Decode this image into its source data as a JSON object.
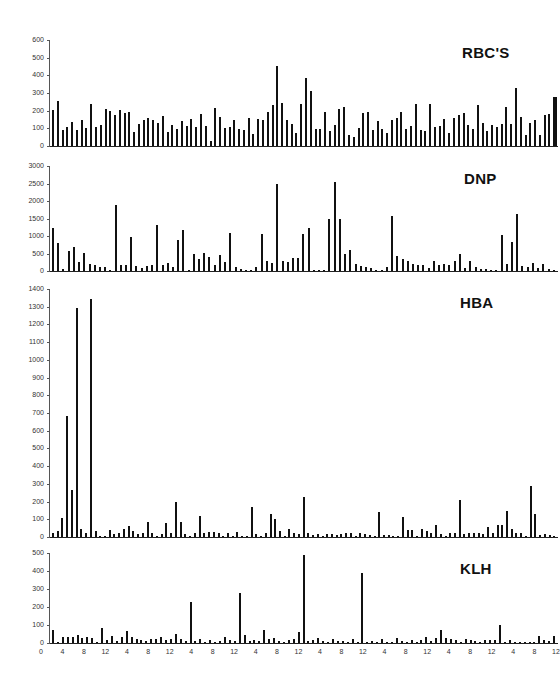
{
  "figure": {
    "x_tick_labels": [
      "0",
      "4",
      "8",
      "12",
      "4",
      "8",
      "12",
      "4",
      "8",
      "12",
      "4",
      "8",
      "12",
      "4",
      "8",
      "12",
      "4",
      "8",
      "12",
      "4",
      "8",
      "12",
      "4",
      "8",
      "12"
    ]
  },
  "chart_data": [
    {
      "type": "bar",
      "title": "RBC'S",
      "xlabel": "",
      "ylabel": "",
      "ylim": [
        0,
        600
      ],
      "yticks": [
        0,
        100,
        200,
        300,
        400,
        500,
        600
      ],
      "grid": false,
      "x_tick_labels": [
        "0",
        "4",
        "8",
        "12",
        "4",
        "8",
        "12",
        "4",
        "8",
        "12",
        "4",
        "8",
        "12",
        "4",
        "8",
        "12",
        "4",
        "8",
        "12",
        "4",
        "8",
        "12",
        "4",
        "8",
        "12"
      ],
      "values": [
        205,
        255,
        90,
        110,
        135,
        90,
        150,
        100,
        235,
        105,
        120,
        210,
        200,
        175,
        205,
        185,
        195,
        80,
        125,
        150,
        160,
        150,
        130,
        170,
        80,
        120,
        95,
        140,
        115,
        155,
        110,
        180,
        115,
        30,
        215,
        165,
        100,
        105,
        150,
        95,
        90,
        160,
        70,
        155,
        145,
        195,
        230,
        455,
        245,
        145,
        125,
        75,
        240,
        385,
        310,
        95,
        95,
        190,
        85,
        120,
        210,
        220,
        60,
        50,
        100,
        185,
        195,
        90,
        140,
        95,
        75,
        150,
        160,
        195,
        95,
        115,
        235,
        90,
        85,
        240,
        110,
        115,
        155,
        75,
        160,
        175,
        185,
        120,
        95,
        230,
        130,
        85,
        120,
        110,
        125,
        220,
        125,
        330,
        165,
        65,
        130,
        150,
        65,
        175,
        180,
        280
      ]
    },
    {
      "type": "bar",
      "title": "DNP",
      "xlabel": "",
      "ylabel": "",
      "ylim": [
        0,
        3000
      ],
      "yticks": [
        0,
        500,
        1000,
        1500,
        2000,
        2500,
        3000
      ],
      "grid": false,
      "x_tick_labels": [
        "0",
        "4",
        "8",
        "12",
        "4",
        "8",
        "12",
        "4",
        "8",
        "12",
        "4",
        "8",
        "12",
        "4",
        "8",
        "12",
        "4",
        "8",
        "12",
        "4",
        "8",
        "12",
        "4",
        "8",
        "12"
      ],
      "values": [
        1220,
        800,
        60,
        560,
        690,
        260,
        520,
        200,
        180,
        110,
        110,
        20,
        1880,
        170,
        170,
        960,
        130,
        100,
        140,
        160,
        1320,
        160,
        240,
        120,
        880,
        1180,
        30,
        490,
        340,
        520,
        410,
        170,
        450,
        270,
        1080,
        120,
        50,
        40,
        20,
        120,
        1070,
        280,
        240,
        2500,
        280,
        260,
        380,
        360,
        1060,
        1220,
        40,
        40,
        40,
        1480,
        2550,
        1480,
        500,
        590,
        190,
        150,
        110,
        80,
        40,
        20,
        120,
        1560,
        430,
        340,
        290,
        200,
        160,
        160,
        100,
        280,
        160,
        200,
        170,
        280,
        480,
        100,
        280,
        120,
        50,
        60,
        20,
        40,
        1020,
        190,
        820,
        1630,
        130,
        110,
        220,
        80,
        190,
        50,
        20
      ]
    },
    {
      "type": "bar",
      "title": "HBA",
      "xlabel": "",
      "ylabel": "",
      "ylim": [
        0,
        1400
      ],
      "yticks": [
        0,
        100,
        200,
        300,
        400,
        500,
        600,
        700,
        800,
        900,
        1000,
        1100,
        1200,
        1300,
        1400
      ],
      "grid": false,
      "x_tick_labels": [
        "0",
        "4",
        "8",
        "12",
        "4",
        "8",
        "12",
        "4",
        "8",
        "12",
        "4",
        "8",
        "12",
        "4",
        "8",
        "12",
        "4",
        "8",
        "12",
        "4",
        "8",
        "12",
        "4",
        "8",
        "12"
      ],
      "values": [
        25,
        35,
        110,
        685,
        265,
        1295,
        45,
        25,
        1345,
        35,
        5,
        0,
        40,
        15,
        25,
        45,
        60,
        35,
        15,
        25,
        85,
        20,
        5,
        15,
        80,
        20,
        200,
        85,
        15,
        5,
        20,
        120,
        20,
        30,
        30,
        25,
        5,
        20,
        5,
        30,
        5,
        0,
        170,
        15,
        5,
        25,
        130,
        100,
        35,
        5,
        45,
        20,
        15,
        225,
        25,
        10,
        15,
        5,
        15,
        15,
        10,
        15,
        25,
        20,
        5,
        25,
        15,
        10,
        5,
        140,
        10,
        10,
        5,
        0,
        115,
        40,
        40,
        5,
        45,
        35,
        25,
        70,
        15,
        5,
        25,
        25,
        210,
        15,
        25,
        20,
        25,
        15,
        55,
        25,
        70,
        70,
        145,
        45,
        25,
        25,
        0,
        290,
        130,
        10,
        15,
        10,
        5
      ]
    },
    {
      "type": "bar",
      "title": "KLH",
      "xlabel": "",
      "ylabel": "",
      "ylim": [
        0,
        500
      ],
      "yticks": [
        0,
        100,
        200,
        300,
        400,
        500
      ],
      "grid": false,
      "x_tick_labels": [
        "0",
        "4",
        "8",
        "12",
        "4",
        "8",
        "12",
        "4",
        "8",
        "12",
        "4",
        "8",
        "12",
        "4",
        "8",
        "12",
        "4",
        "8",
        "12",
        "4",
        "8",
        "12",
        "4",
        "8",
        "12"
      ],
      "values": [
        70,
        5,
        35,
        35,
        35,
        45,
        30,
        35,
        30,
        0,
        85,
        15,
        40,
        10,
        35,
        65,
        35,
        25,
        15,
        10,
        20,
        25,
        35,
        15,
        25,
        50,
        25,
        10,
        230,
        10,
        20,
        5,
        15,
        5,
        10,
        35,
        15,
        10,
        280,
        45,
        10,
        15,
        10,
        75,
        20,
        30,
        10,
        5,
        15,
        20,
        60,
        490,
        10,
        15,
        30,
        10,
        0,
        25,
        10,
        10,
        0,
        20,
        5,
        390,
        5,
        10,
        5,
        25,
        5,
        5,
        30,
        10,
        5,
        15,
        5,
        15,
        35,
        10,
        30,
        70,
        30,
        20,
        15,
        5,
        25,
        15,
        10,
        5,
        15,
        15,
        15,
        100,
        5,
        15,
        5,
        5,
        5,
        0,
        5,
        40,
        15,
        10,
        40
      ]
    }
  ],
  "panels": [
    {
      "title": "RBC'S",
      "ytick_labels": [
        "600",
        "500",
        "400",
        "300",
        "200",
        "100",
        "0"
      ]
    },
    {
      "title": "DNP",
      "ytick_labels": [
        "3000",
        "2500",
        "2000",
        "1500",
        "1000",
        "500",
        "0"
      ]
    },
    {
      "title": "HBA",
      "ytick_labels": [
        "1400",
        "1300",
        "1200",
        "1100",
        "1000",
        "900",
        "800",
        "700",
        "600",
        "500",
        "400",
        "300",
        "200",
        "100",
        "0"
      ]
    },
    {
      "title": "KLH",
      "ytick_labels": [
        "500",
        "400",
        "300",
        "200",
        "100",
        "0"
      ]
    }
  ]
}
